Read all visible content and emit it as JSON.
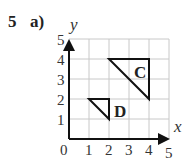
{
  "question": {
    "number": "5",
    "part": "a)"
  },
  "diagram": {
    "x_axis_label": "x",
    "y_axis_label": "y",
    "origin_label": "0",
    "x_ticks": [
      "1",
      "2",
      "3",
      "4",
      "5"
    ],
    "y_ticks": [
      "1",
      "2",
      "3",
      "4",
      "5"
    ],
    "grid_range": {
      "x": [
        0,
        5
      ],
      "y": [
        0,
        5
      ]
    },
    "shapes": [
      {
        "label": "C",
        "vertices": [
          [
            2,
            4
          ],
          [
            4,
            4
          ],
          [
            4,
            2
          ]
        ]
      },
      {
        "label": "D",
        "vertices": [
          [
            1,
            2
          ],
          [
            2,
            2
          ],
          [
            2,
            1
          ]
        ]
      }
    ],
    "colors": {
      "grid": "#c8c8c8",
      "axes": "#111111",
      "shape": "#111111"
    }
  }
}
